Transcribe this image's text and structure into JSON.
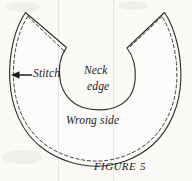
{
  "figure": {
    "caption": "FIGURE 5",
    "caption_word": "FIGURE",
    "caption_number": "5",
    "background_color": "#fbfaf7",
    "ink_color": "#1d1b1a",
    "line_color": "#33312f"
  },
  "labels": {
    "stitch": "Stitch",
    "neck_edge_line1": "Neck",
    "neck_edge_line2": "edge",
    "neck_edge_full": "Neck edge",
    "wrong_side": "Wrong side"
  },
  "diagram": {
    "type": "sewing-pattern-illustration",
    "elements": [
      {
        "name": "fabric-outline",
        "style": "solid",
        "stroke": "#33312f",
        "stroke_width": 1.1
      },
      {
        "name": "stitch-line",
        "style": "dashed",
        "stroke": "#33312f",
        "stroke_width": 0.9,
        "dash": "3 2.6"
      },
      {
        "name": "neck-opening",
        "style": "solid",
        "stroke": "#33312f",
        "stroke_width": 1.1
      },
      {
        "name": "stitch-arrow",
        "style": "solid",
        "direction": "left",
        "stroke": "#1d1b1a"
      }
    ]
  },
  "artifacts": {
    "scan_lines": [
      {
        "name": "page-scan-line-left",
        "x": 58
      },
      {
        "name": "page-scan-line-right",
        "x": 113
      }
    ]
  }
}
